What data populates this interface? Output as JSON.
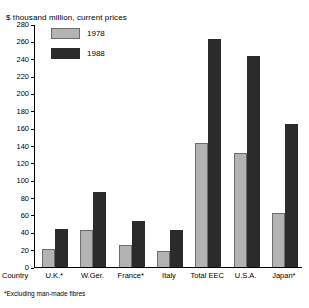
{
  "chart_data": {
    "type": "bar",
    "title": "$ thousand million, current prices",
    "xlabel": "Country",
    "ylabel": "",
    "ylim": [
      0,
      280
    ],
    "ytick_step": 20,
    "yticks": [
      0,
      20,
      40,
      60,
      80,
      100,
      120,
      140,
      160,
      180,
      200,
      220,
      240,
      260,
      280
    ],
    "grid": false,
    "legend_position": "top-left",
    "categories": [
      "U.K.*",
      "W.Ger.",
      "France*",
      "Italy",
      "Total EEC",
      "U.S.A.",
      "Japan*"
    ],
    "series": [
      {
        "name": "1978",
        "color": "#b3b3b3",
        "values": [
          21,
          43,
          25,
          19,
          143,
          131,
          62
        ]
      },
      {
        "name": "1988",
        "color": "#2b2b2b",
        "values": [
          44,
          86,
          53,
          43,
          263,
          243,
          165
        ]
      }
    ],
    "annotations": [
      "*Excluding man-made fibres"
    ]
  },
  "footnote": "*Excluding man-made fibres",
  "axis_name": "Country"
}
